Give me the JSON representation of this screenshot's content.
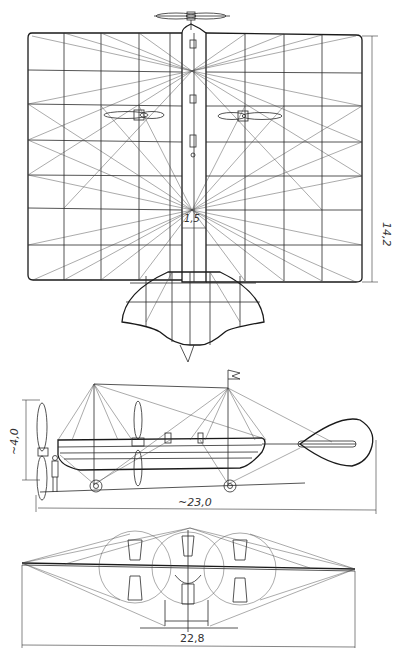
{
  "figure": {
    "views": [
      {
        "name": "plan-view",
        "dimensions": [
          {
            "label": "14,2",
            "orientation": "vertical"
          },
          {
            "label": "1,5",
            "orientation": "horizontal"
          }
        ]
      },
      {
        "name": "side-view",
        "dimensions": [
          {
            "label": "~4,0",
            "orientation": "vertical"
          },
          {
            "label": "~23,0",
            "orientation": "horizontal"
          }
        ]
      },
      {
        "name": "front-view",
        "dimensions": [
          {
            "label": "22,8",
            "orientation": "horizontal"
          }
        ]
      }
    ]
  },
  "labels": {
    "span_height": "14,2",
    "fuselage_width": "1,5",
    "height": "~4,0",
    "length": "~23,0",
    "span": "22,8"
  },
  "colors": {
    "ink": "#2a2a2a",
    "paper": "#ffffff"
  }
}
